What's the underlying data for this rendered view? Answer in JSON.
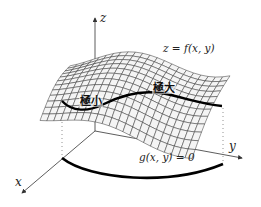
{
  "figure": {
    "axes": {
      "x_label": "x",
      "y_label": "y",
      "z_label": "z"
    },
    "surface_label": "z = f(x, y)",
    "constraint_label": "g(x, y) = 0",
    "extrema_labels": {
      "minimum": "極小",
      "maximum": "極大"
    },
    "colors": {
      "axis": "#333333",
      "grid": "#333333",
      "surface_fill": "#f2f2f2",
      "curve": "#000000"
    }
  }
}
